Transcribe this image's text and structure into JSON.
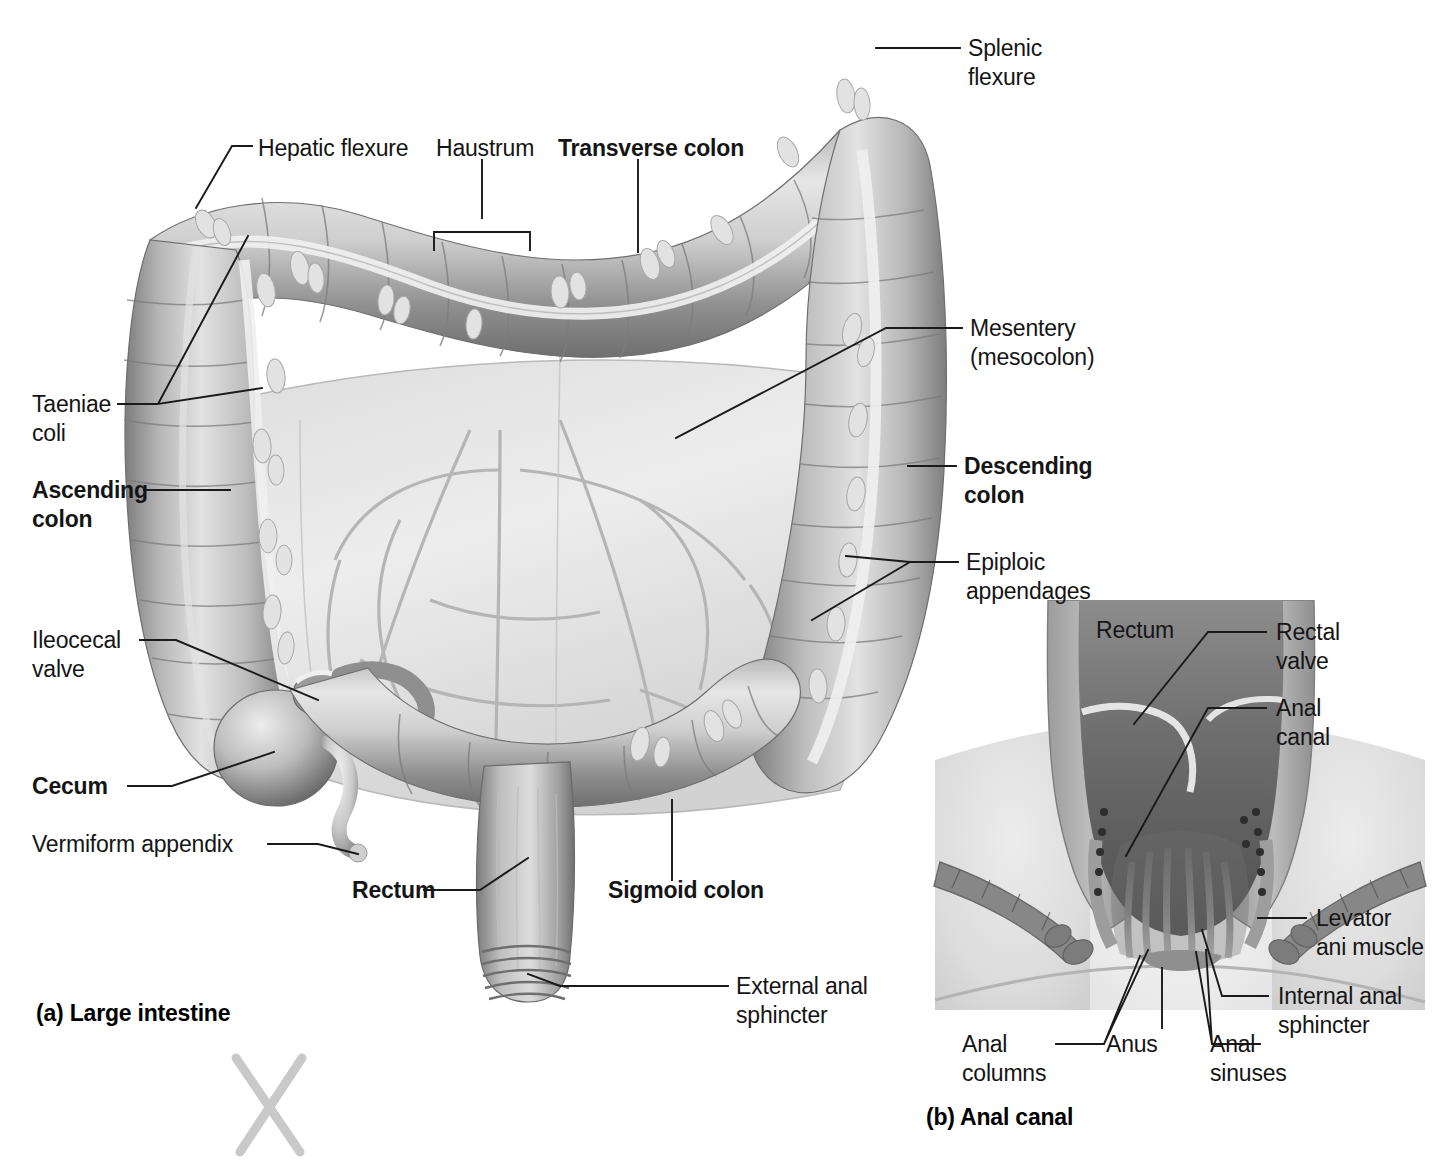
{
  "figure": {
    "panel_a": {
      "caption": "(a) Large intestine",
      "labels": {
        "hepatic_flexure": "Hepatic flexure",
        "haustrum": "Haustrum",
        "transverse_colon": "Transverse colon",
        "splenic_flexure": "Splenic\nflexure",
        "mesentery": "Mesentery\n(mesocolon)",
        "taeniae_coli": "Taeniae\ncoli",
        "ascending_colon": "Ascending\ncolon",
        "descending_colon": "Descending\ncolon",
        "epiploic_appendages": "Epiploic\nappendages",
        "ileocecal_valve": "Ileocecal\nvalve",
        "cecum": "Cecum",
        "vermiform_appendix": "Vermiform appendix",
        "rectum": "Rectum",
        "sigmoid_colon": "Sigmoid colon",
        "external_anal_sphincter": "External anal\nsphincter"
      }
    },
    "panel_b": {
      "caption": "(b) Anal canal",
      "labels": {
        "rectum": "Rectum",
        "rectal_valve": "Rectal\nvalve",
        "anal_canal": "Anal\ncanal",
        "levator_ani_muscle": "Levator\nani muscle",
        "internal_anal_sphincter": "Internal anal\nsphincter",
        "anal_columns": "Anal\ncolumns",
        "anus": "Anus",
        "anal_sinuses": "Anal\nsinuses"
      }
    },
    "marks": {
      "stray_x": "X"
    },
    "colors": {
      "background": "#ffffff",
      "text": "#151515",
      "leader_line": "#1a1a1a",
      "tissue_mid": "#9a9a9a",
      "tissue_light": "#d9d9d9",
      "tissue_dark": "#6d6d6d",
      "mesentery": "#cfcfcf",
      "stray_mark": "#c9c9c9"
    }
  }
}
